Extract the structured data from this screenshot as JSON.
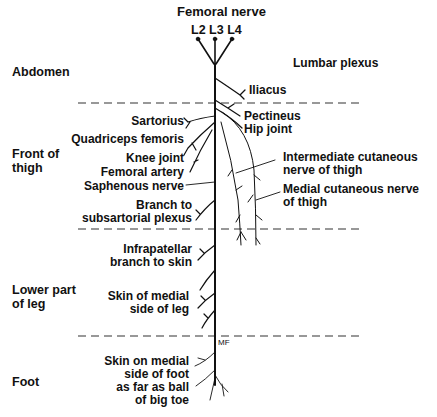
{
  "title": "Femoral nerve",
  "roots": [
    "L2",
    "L3",
    "L4"
  ],
  "plexus_label": "Lumbar plexus",
  "regions": [
    {
      "id": "abdomen",
      "label": "Abdomen"
    },
    {
      "id": "front-of-thigh",
      "line1": "Front of",
      "line2": "thigh"
    },
    {
      "id": "lower-leg",
      "line1": "Lower part",
      "line2": "of leg"
    },
    {
      "id": "foot",
      "label": "Foot"
    }
  ],
  "branches_left": {
    "sartorius": "Sartorius",
    "quadriceps": "Quadriceps femoris",
    "knee": "Knee joint",
    "femoral_artery": "Femoral artery",
    "saphenous": "Saphenous nerve",
    "subsartorial_1": "Branch to",
    "subsartorial_2": "subsartorial plexus",
    "infrapatellar_1": "Infrapatellar",
    "infrapatellar_2": "branch to skin",
    "skin_leg_1": "Skin of medial",
    "skin_leg_2": "side of leg",
    "foot_1": "Skin on medial",
    "foot_2": "side of foot",
    "foot_3": "as far as ball",
    "foot_4": "of big toe"
  },
  "branches_right": {
    "iliacus": "Iliacus",
    "pectineus": "Pectineus",
    "hip": "Hip joint",
    "intermediate_1": "Intermediate cutaneous",
    "intermediate_2": "nerve of thigh",
    "medial_1": "Medial cutaneous nerve",
    "medial_2": "of thigh"
  },
  "malleolus_mark": "MF",
  "colors": {
    "line": "#111111",
    "dash": "#333333",
    "background": "#ffffff"
  }
}
